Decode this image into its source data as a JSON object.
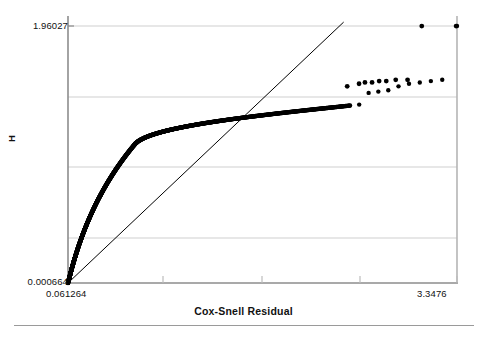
{
  "chart_data": {
    "type": "scatter",
    "title": "",
    "subtitle": "",
    "xlabel": "Cox-Snell Residual",
    "ylabel": "H",
    "xlim": [
      0.061264,
      3.3476
    ],
    "ylim": [
      0.000664,
      1.96027
    ],
    "xticks": [
      0.061264,
      3.3476
    ],
    "xticklabels": [
      "0.061264",
      "3.3476"
    ],
    "yticks": [
      0.000664,
      1.96027
    ],
    "yticklabels": [
      "0.000664",
      "1.96027"
    ],
    "grid": "horizontal",
    "gridlines_y": [
      1.96027,
      1.47,
      0.98,
      0.49
    ],
    "legend": "none",
    "marker": "filled-circle",
    "marker_color": "#000000",
    "reference_line": {
      "name": "45-degree reference line",
      "from": [
        0.061264,
        0.000664
      ],
      "to": [
        2.39,
        1.99
      ],
      "color": "#000000",
      "width": 1
    },
    "series": [
      {
        "name": "Nelson-Aalen cumulative hazard vs Cox-Snell residual",
        "x": [
          0.0613,
          0.0645,
          0.0678,
          0.0712,
          0.0748,
          0.0785,
          0.0823,
          0.0862,
          0.0903,
          0.0945,
          0.0989,
          0.1034,
          0.1081,
          0.1129,
          0.1179,
          0.1231,
          0.1284,
          0.1339,
          0.1396,
          0.1455,
          0.1516,
          0.1579,
          0.1644,
          0.1711,
          0.178,
          0.1852,
          0.1926,
          0.2002,
          0.2081,
          0.2162,
          0.2246,
          0.2333,
          0.2422,
          0.2515,
          0.261,
          0.2709,
          0.281,
          0.2915,
          0.3023,
          0.3135,
          0.325,
          0.3369,
          0.3492,
          0.3619,
          0.375,
          0.3885,
          0.4024,
          0.4168,
          0.4317,
          0.447,
          0.4629,
          0.4792,
          0.4961,
          0.5136,
          0.5316,
          0.5502,
          0.5694,
          0.5893,
          0.6098,
          0.631,
          0.6529,
          0.6755,
          0.6989,
          0.7231,
          0.748,
          0.7738,
          0.8005,
          0.828,
          0.8565,
          0.8859,
          0.9163,
          0.9477,
          0.9801,
          1.0136,
          1.0482,
          1.0839,
          1.1208,
          1.1589,
          1.1982,
          1.2388,
          1.2806,
          1.3238,
          1.3683,
          1.4142,
          1.4616,
          1.5104,
          1.5607,
          1.6126,
          1.666,
          1.721,
          1.7777,
          1.836,
          1.8961,
          1.958,
          2.0216,
          2.0871,
          2.1545,
          2.2238,
          2.2951,
          2.3684,
          2.4438,
          2.5213,
          2.601,
          2.6829,
          2.767,
          2.8534,
          2.9421,
          3.0332,
          3.1268,
          3.2229,
          3.3476
        ],
        "y": [
          0.0007,
          0.0118,
          0.0236,
          0.0358,
          0.0483,
          0.0611,
          0.0742,
          0.0876,
          0.1012,
          0.1151,
          0.1293,
          0.1437,
          0.1584,
          0.1733,
          0.1884,
          0.2038,
          0.2194,
          0.2352,
          0.2512,
          0.2675,
          0.2839,
          0.3006,
          0.3174,
          0.3345,
          0.3517,
          0.3692,
          0.3868,
          0.4046,
          0.4226,
          0.4408,
          0.4592,
          0.4777,
          0.4965,
          0.5154,
          0.5345,
          0.5538,
          0.5732,
          0.5928,
          0.6126,
          0.6326,
          0.6527,
          0.673,
          0.6934,
          0.714,
          0.7348,
          0.7557,
          0.7768,
          0.798,
          0.8194,
          0.8409,
          0.8626,
          0.8844,
          0.9064,
          0.9285,
          0.9508,
          0.9732,
          0.9957,
          1.0184,
          1.0412,
          1.0642,
          1.0808,
          1.0934,
          1.1042,
          1.1138,
          1.1226,
          1.1308,
          1.1386,
          1.146,
          1.1532,
          1.1601,
          1.1668,
          1.1733,
          1.1797,
          1.186,
          1.1922,
          1.1983,
          1.2044,
          1.2104,
          1.2164,
          1.2223,
          1.2282,
          1.2341,
          1.24,
          1.2459,
          1.2518,
          1.2577,
          1.2636,
          1.2696,
          1.2756,
          1.2816,
          1.2877,
          1.2939,
          1.3001,
          1.3064,
          1.3128,
          1.3193,
          1.3259,
          1.3326,
          1.3394,
          1.3464,
          1.3536,
          1.3609,
          1.45,
          1.46,
          1.47,
          1.5,
          1.52,
          1.53,
          1.54,
          1.55,
          1.96
        ]
      }
    ],
    "tail_points": {
      "note": "sparse individual markers in upper-right region",
      "x": [
        2.42,
        2.52,
        2.57,
        2.63,
        2.69,
        2.75,
        2.83,
        2.93,
        3.05,
        3.34
      ],
      "y": [
        1.5,
        1.52,
        1.53,
        1.53,
        1.54,
        1.54,
        1.55,
        1.55,
        1.96,
        1.96
      ]
    }
  },
  "axis": {
    "ytick_top": "1.96027",
    "ytick_bottom": "0.000664",
    "xtick_left": "0.061264",
    "xtick_right": "3.3476",
    "xlabel": "Cox-Snell Residual",
    "ylabel": "H"
  },
  "colors": {
    "marker": "#000000",
    "line": "#000000",
    "grid": "#cfcfcf",
    "axis": "#9a9a9a",
    "text": "#111111"
  }
}
